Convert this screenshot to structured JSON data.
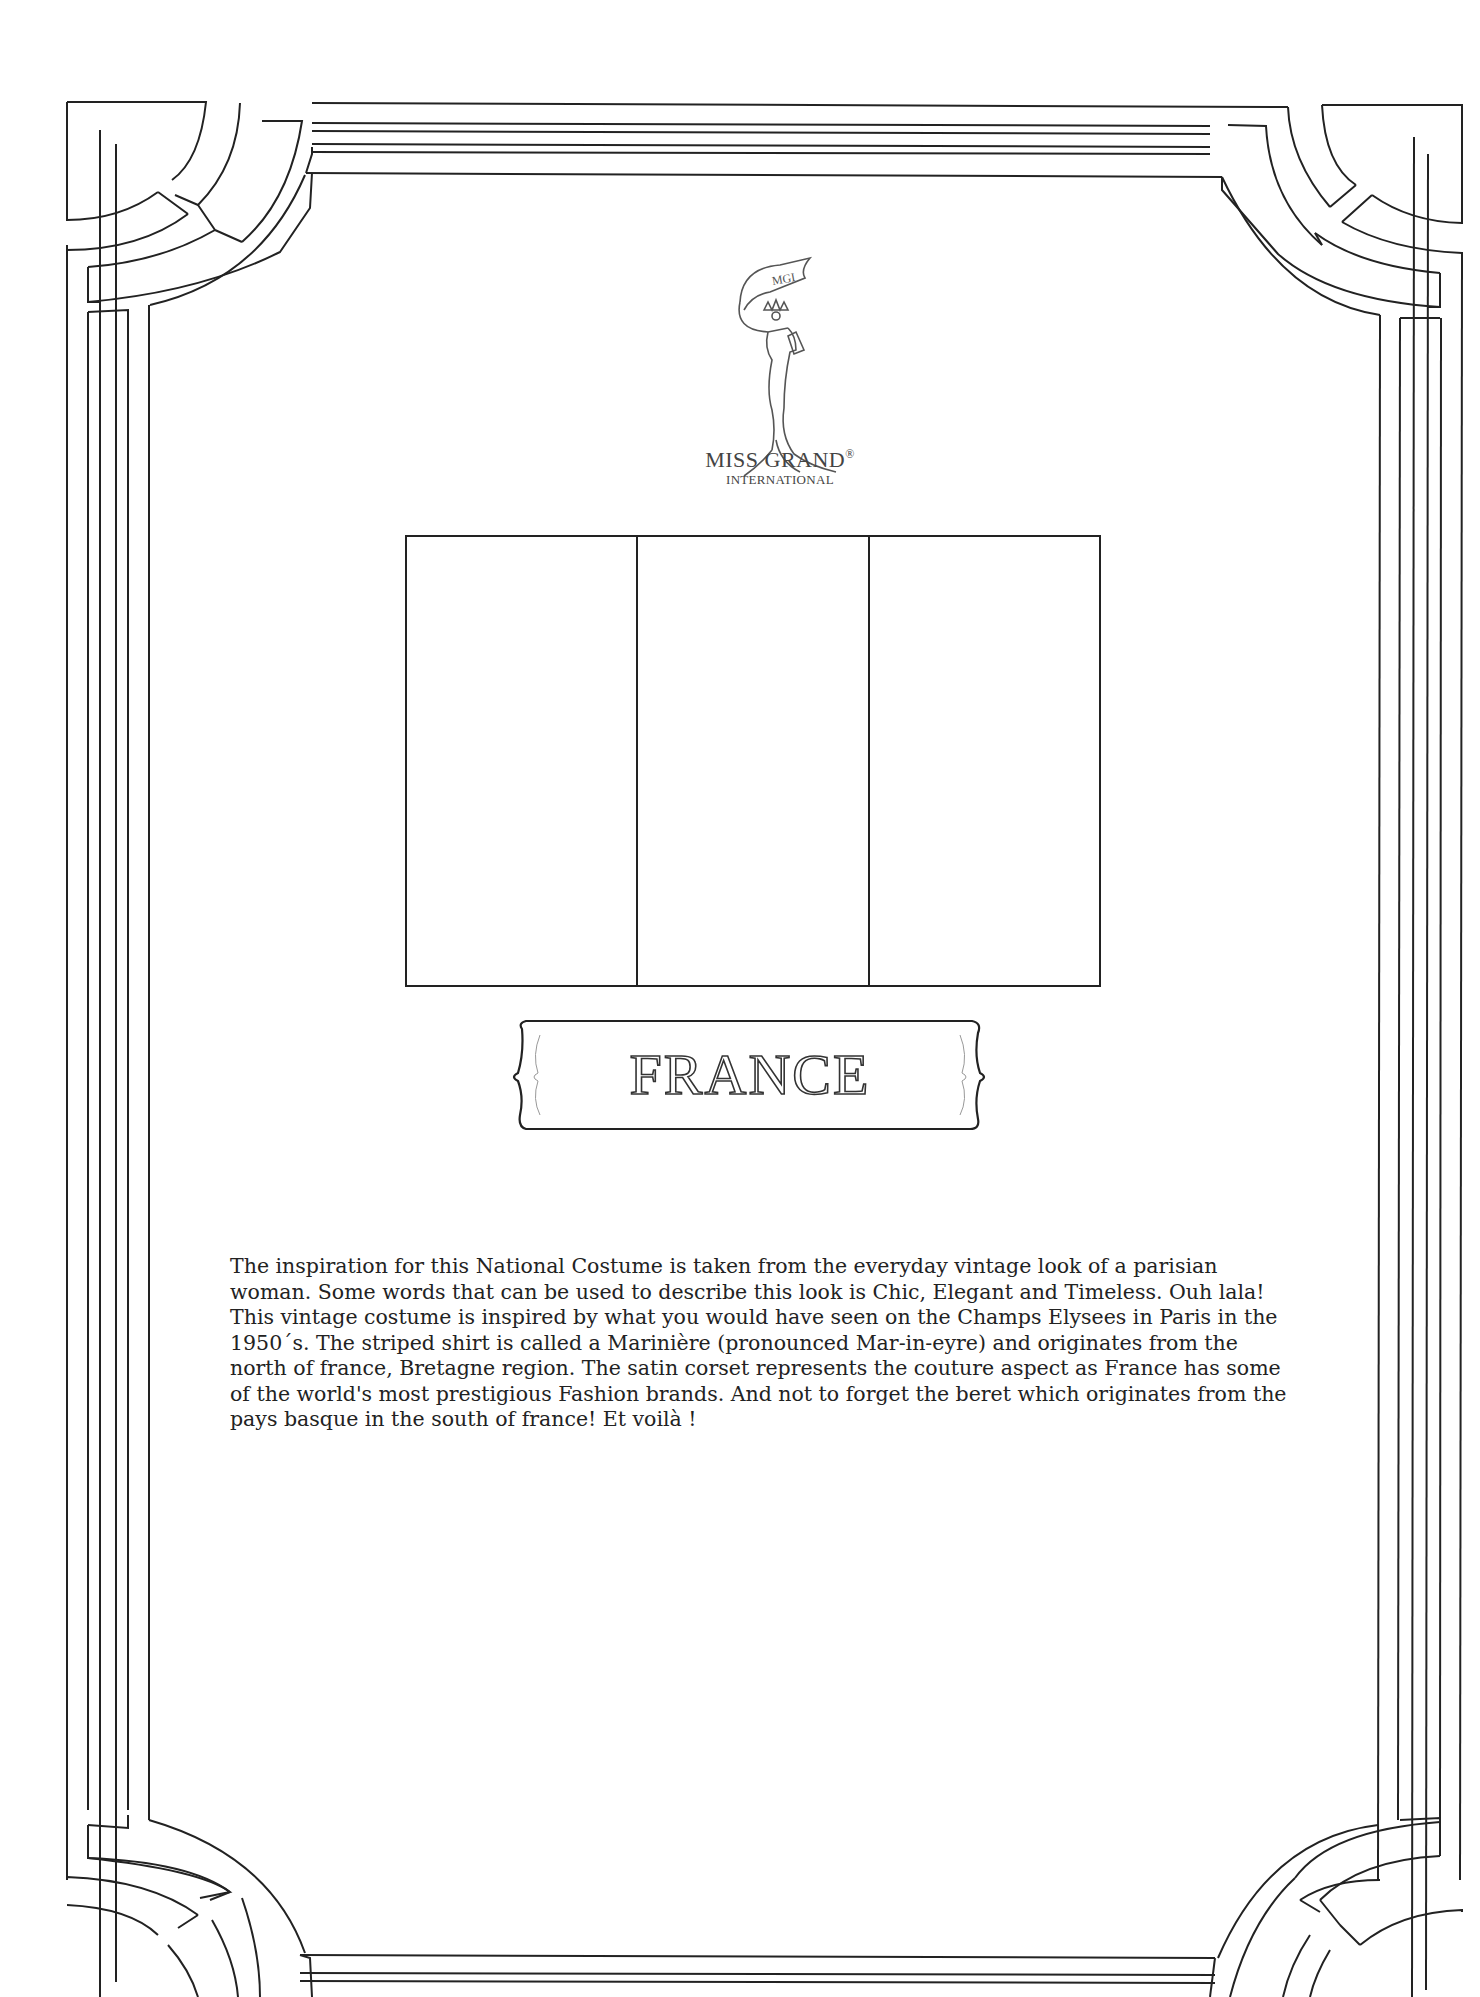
{
  "logo": {
    "ribbon_text": "MGI",
    "title": "MISS GRAND",
    "registered_mark": "®",
    "subtitle": "INTERNATIONAL",
    "icon": "pageant-woman-silhouette-icon"
  },
  "flag": {
    "country": "France",
    "stripes": 3,
    "orientation": "vertical",
    "style": "outline-only"
  },
  "banner": {
    "label": "FRANCE"
  },
  "description": {
    "paragraphs": [
      "The inspiration for this National Costume is taken from the everyday vintage look of a parisian woman.  Some words that can be used to describe this look is Chic, Elegant and Timeless. Ouh lala!",
      "This vintage costume is inspired by what you would have seen on the Champs Elysees in Paris in the 1950´s. The striped shirt is called a Marinière (pronounced Mar-in-eyre) and originates from the north of france, Bretagne region. The satin corset represents the couture aspect as France has some of the world's most prestigious Fashion brands. And not to forget the beret which originates from the pays basque in the south of france! Et voilà !"
    ]
  },
  "colors": {
    "line": "#222222",
    "background": "#ffffff",
    "text": "#222222"
  }
}
